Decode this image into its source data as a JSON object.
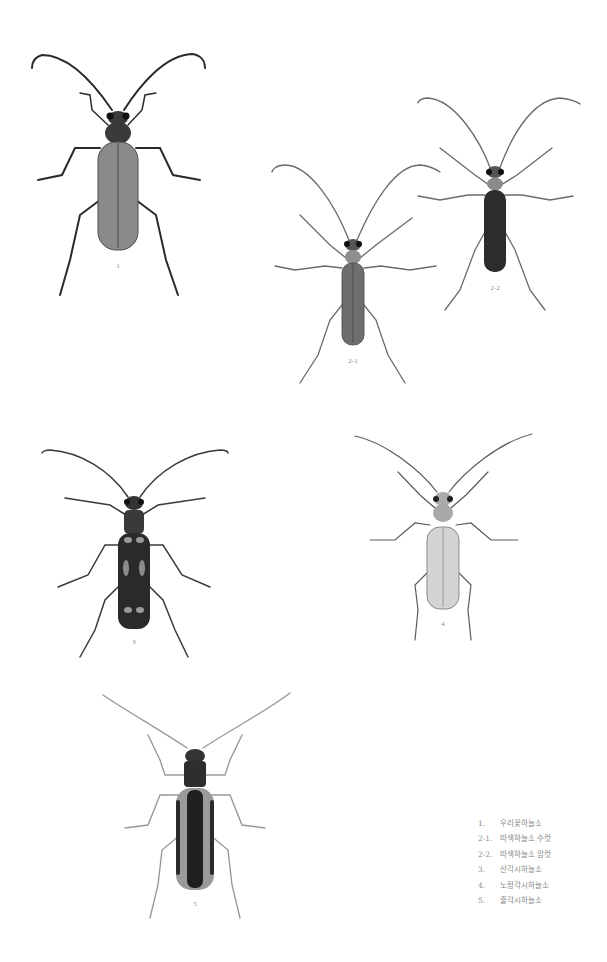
{
  "plate": {
    "background": "#ffffff",
    "figures": [
      {
        "id": "1",
        "label": "1",
        "tone": "medium",
        "elytra_color": "#8a8a8a",
        "pronotum_color": "#3a3a3a"
      },
      {
        "id": "2-1",
        "label": "2-1",
        "tone": "medium",
        "elytra_color": "#6e6e6e",
        "pronotum_color": "#8f8f8f"
      },
      {
        "id": "2-2",
        "label": "2-2",
        "tone": "dark",
        "elytra_color": "#2c2c2c",
        "pronotum_color": "#8a8a8a"
      },
      {
        "id": "3",
        "label": "3",
        "tone": "dark-spotted",
        "elytra_color": "#2a2a2a",
        "pronotum_color": "#3a3a3a"
      },
      {
        "id": "4",
        "label": "4",
        "tone": "light",
        "elytra_color": "#d4d4d4",
        "pronotum_color": "#a8a8a8"
      },
      {
        "id": "5",
        "label": "5",
        "tone": "striped",
        "elytra_color": "#9a9a9a",
        "pronotum_color": "#2e2e2e"
      }
    ]
  },
  "legend": {
    "items": [
      {
        "num": "1.",
        "name": "우리꽃하늘소"
      },
      {
        "num": "2-1.",
        "name": "따색하늘소 수컷"
      },
      {
        "num": "2-2.",
        "name": "따색하늘소 암컷"
      },
      {
        "num": "3.",
        "name": "산각시하늘소"
      },
      {
        "num": "4.",
        "name": "노랑각시하늘소"
      },
      {
        "num": "5.",
        "name": "줄각시하늘소"
      }
    ]
  }
}
